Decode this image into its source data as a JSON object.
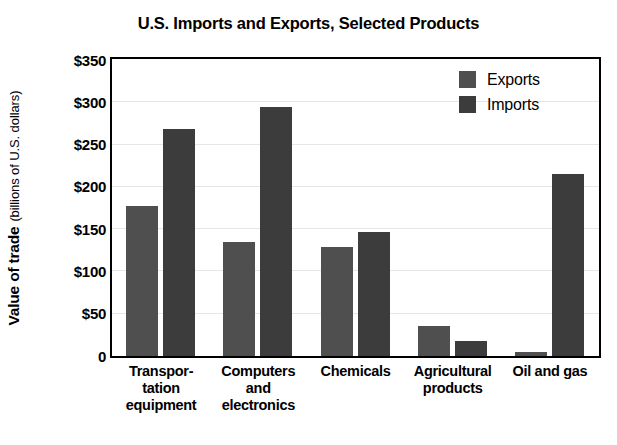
{
  "chart_data": {
    "type": "bar",
    "title": "U.S. Imports and Exports, Selected Products",
    "xlabel": "",
    "ylabel": "Value of trade",
    "ylabel_units": "(billions of U.S. dollars)",
    "ylim": [
      0,
      350
    ],
    "ytick_values": [
      350,
      300,
      250,
      200,
      150,
      100,
      50,
      0
    ],
    "ytick_labels": [
      "$350",
      "$300",
      "$250",
      "$200",
      "$150",
      "$100",
      "$50",
      "0"
    ],
    "grid": true,
    "grid_axis": "y",
    "legend_position": "top-right",
    "categories": [
      "Transportation equipment",
      "Computers and electronics",
      "Chemicals",
      "Agricultural products",
      "Oil and gas"
    ],
    "category_label_lines": [
      [
        "Transpor-",
        "tation",
        "equipment"
      ],
      [
        "Computers",
        "and",
        "electronics"
      ],
      [
        "Chemicals"
      ],
      [
        "Agricultural",
        "products"
      ],
      [
        "Oil and gas"
      ]
    ],
    "series": [
      {
        "name": "Exports",
        "color": "#4f4f4f",
        "values": [
          177,
          135,
          129,
          35,
          5
        ]
      },
      {
        "name": "Imports",
        "color": "#3c3c3c",
        "values": [
          268,
          295,
          147,
          18,
          215
        ]
      }
    ]
  },
  "legend": {
    "items": [
      {
        "label": "Exports",
        "color": "#4f4f4f"
      },
      {
        "label": "Imports",
        "color": "#3c3c3c"
      }
    ]
  }
}
